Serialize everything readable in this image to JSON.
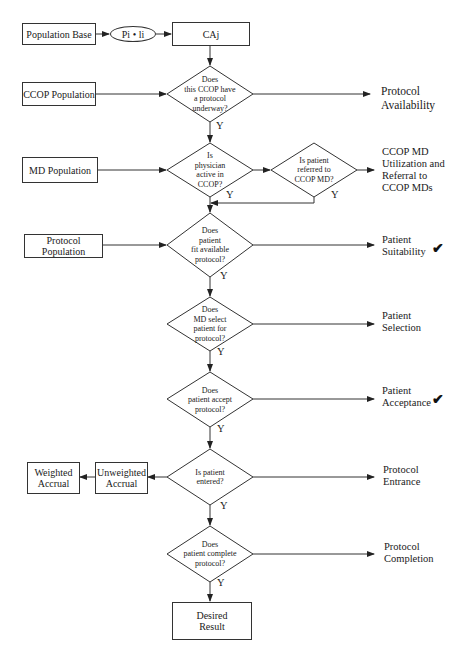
{
  "flowchart": {
    "sources": {
      "population_base": "Population Base",
      "pi_li": "Pi • li",
      "caj": "CAj",
      "ccop_population": "CCOP Population",
      "md_population": "MD Population",
      "protocol_population": "Protocol Population"
    },
    "decisions": [
      {
        "id": "protocol_underway",
        "lines": [
          "Does",
          "this CCOP have",
          "a protocol",
          "underway?"
        ],
        "yes": "Y"
      },
      {
        "id": "physician_active",
        "lines": [
          "Is",
          "physician",
          "active in",
          "CCOP?"
        ],
        "yes": "Y"
      },
      {
        "id": "referred_to_md",
        "lines": [
          "Is patient",
          "referred to",
          "CCOP MD?"
        ],
        "yes": "Y"
      },
      {
        "id": "fit_protocol",
        "lines": [
          "Does",
          "patient",
          "fit available",
          "protocol?"
        ],
        "yes": "Y"
      },
      {
        "id": "md_select",
        "lines": [
          "Does",
          "MD select",
          "patient for",
          "protocol?"
        ],
        "yes": "Y"
      },
      {
        "id": "patient_accept",
        "lines": [
          "Does",
          "patient accept",
          "protocol?"
        ],
        "yes": "Y"
      },
      {
        "id": "patient_entered",
        "lines": [
          "Is patient",
          "entered?"
        ],
        "yes": "Y"
      },
      {
        "id": "patient_complete",
        "lines": [
          "Does",
          "patient complete",
          "protocol?"
        ],
        "yes": "Y"
      }
    ],
    "outcomes": {
      "protocol_availability": [
        "Protocol",
        "Availability"
      ],
      "ccop_md_utilization": [
        "CCOP MD",
        "Utilization and",
        "Referral to",
        "CCOP MDs"
      ],
      "patient_suitability": [
        "Patient",
        "Suitability"
      ],
      "patient_selection": [
        "Patient",
        "Selection"
      ],
      "patient_acceptance": [
        "Patient",
        "Acceptance"
      ],
      "protocol_entrance": [
        "Protocol",
        "Entrance"
      ],
      "protocol_completion": [
        "Protocol",
        "Completion"
      ]
    },
    "accrual": {
      "unweighted": [
        "Unweighted",
        "Accrual"
      ],
      "weighted": [
        "Weighted",
        "Accrual"
      ]
    },
    "final": [
      "Desired",
      "Result"
    ],
    "checkmark": "✔"
  }
}
